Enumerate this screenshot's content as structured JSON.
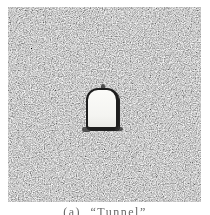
{
  "figure": {
    "caption": {
      "label": "(a)",
      "text": "(a) “Tunnel”"
    },
    "image": {
      "subject": "noisy-grayscale-square-with-tunnel-cutout"
    },
    "colors": {
      "page_background": "#ffffff",
      "noise_dark": "#2e2e2e",
      "noise_light": "#d4d4d4",
      "tunnel_fill": "#f6f6f3",
      "tunnel_outline": "#1d1d1d",
      "caption_text": "#555555"
    }
  }
}
